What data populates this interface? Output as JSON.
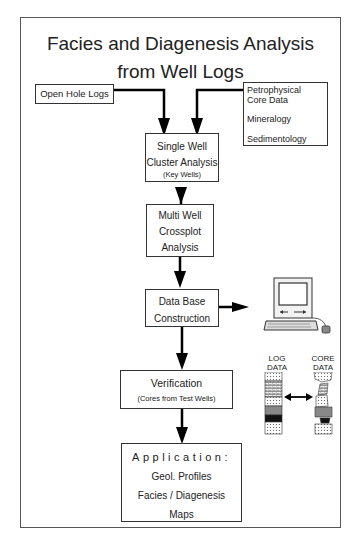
{
  "title": {
    "line1": "Facies and Diagenesis Analysis",
    "line2": "from Well Logs"
  },
  "boxes": {
    "open_hole_logs": {
      "label": "Open Hole Logs"
    },
    "core_data": {
      "lines": [
        "Petrophysical",
        "Core Data",
        "Mineralogy",
        "Sedimentology"
      ]
    },
    "single_well": {
      "lines": [
        "Single Well",
        "Cluster Analysis"
      ],
      "note": "(Key Wells)"
    },
    "multi_well": {
      "lines": [
        "Multi Well",
        "Crossplot",
        "Analysis"
      ]
    },
    "data_base": {
      "lines": [
        "Data Base",
        "Construction"
      ]
    },
    "verification": {
      "title": "Verification",
      "note": "(Cores from Test Wells)"
    },
    "application": {
      "title": "Application:",
      "lines": [
        "Geol. Profiles",
        "Facies / Diagenesis",
        "Maps"
      ]
    }
  },
  "illustrations": {
    "computer": {
      "icon": "computer-icon"
    },
    "log_data_label": [
      "LOG",
      "DATA"
    ],
    "core_data_label": [
      "CORE",
      "DATA"
    ]
  }
}
